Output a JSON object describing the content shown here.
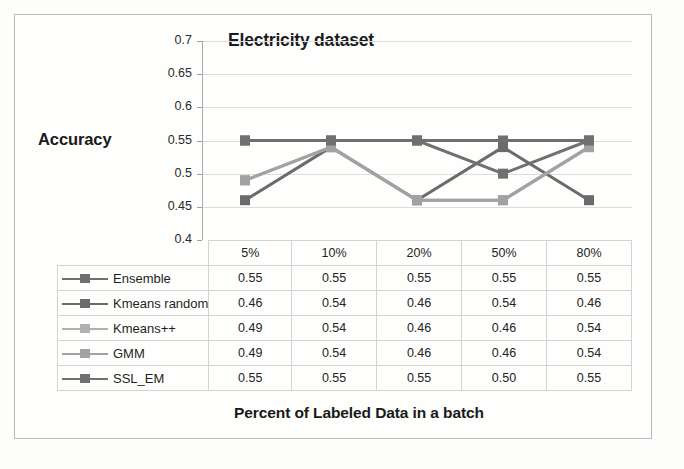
{
  "figure": {
    "background_color": "#fdfdfb",
    "border_color": "#b9babb"
  },
  "chart_data": {
    "type": "line",
    "title": "Electricity dataset",
    "xlabel": "Percent of Labeled Data in a batch",
    "ylabel": "Accuracy",
    "categories": [
      "5%",
      "10%",
      "20%",
      "50%",
      "80%"
    ],
    "ylim": [
      0.4,
      0.7
    ],
    "ytick_step": 0.05,
    "yticks": [
      "0.7",
      "0.65",
      "0.6",
      "0.55",
      "0.5",
      "0.45",
      "0.4"
    ],
    "ytick_values": [
      0.7,
      0.65,
      0.6,
      0.55,
      0.5,
      0.45,
      0.4
    ],
    "grid": true,
    "legend_position": "data-table-left-column",
    "marker": "square",
    "series": [
      {
        "name": "Ensemble",
        "values": [
          0.55,
          0.55,
          0.55,
          0.55,
          0.55
        ],
        "labels": [
          "0.55",
          "0.55",
          "0.55",
          "0.55",
          "0.55"
        ],
        "color": "#6f6f6f"
      },
      {
        "name": "Kmeans random",
        "values": [
          0.46,
          0.54,
          0.46,
          0.54,
          0.46
        ],
        "labels": [
          "0.46",
          "0.54",
          "0.46",
          "0.54",
          "0.46"
        ],
        "color": "#6b6b6b"
      },
      {
        "name": "Kmeans++",
        "values": [
          0.49,
          0.54,
          0.46,
          0.46,
          0.54
        ],
        "labels": [
          "0.49",
          "0.54",
          "0.46",
          "0.46",
          "0.54"
        ],
        "color": "#b0b0b0"
      },
      {
        "name": "GMM",
        "values": [
          0.49,
          0.54,
          0.46,
          0.46,
          0.54
        ],
        "labels": [
          "0.49",
          "0.54",
          "0.46",
          "0.46",
          "0.54"
        ],
        "color": "#a2a2a2"
      },
      {
        "name": "SSL_EM",
        "values": [
          0.55,
          0.55,
          0.55,
          0.5,
          0.55
        ],
        "labels": [
          "0.55",
          "0.55",
          "0.55",
          "0.50",
          "0.55"
        ],
        "color": "#707070"
      }
    ]
  },
  "table": {
    "corner_label": "",
    "column_headers": [
      "5%",
      "10%",
      "20%",
      "50%",
      "80%"
    ],
    "rows": [
      {
        "label": "Ensemble",
        "cells": [
          "0.55",
          "0.55",
          "0.55",
          "0.55",
          "0.55"
        ]
      },
      {
        "label": "Kmeans random",
        "cells": [
          "0.46",
          "0.54",
          "0.46",
          "0.54",
          "0.46"
        ]
      },
      {
        "label": "Kmeans++",
        "cells": [
          "0.49",
          "0.54",
          "0.46",
          "0.46",
          "0.54"
        ]
      },
      {
        "label": "GMM",
        "cells": [
          "0.49",
          "0.54",
          "0.46",
          "0.46",
          "0.54"
        ]
      },
      {
        "label": "SSL_EM",
        "cells": [
          "0.55",
          "0.55",
          "0.55",
          "0.50",
          "0.55"
        ]
      }
    ]
  }
}
